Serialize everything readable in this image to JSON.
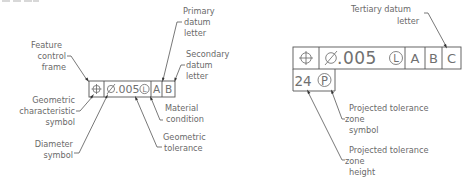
{
  "left_diagram": {
    "frame": {
      "cells": [
        {
          "id": "geometric_characteristic",
          "symbol": "position-icon",
          "text": "⌖"
        },
        {
          "id": "tolerance",
          "diameter": "Ø",
          "value": ".005",
          "modifier": "L"
        },
        {
          "id": "primary_datum",
          "text": "A"
        },
        {
          "id": "secondary_datum",
          "text": "B"
        }
      ]
    },
    "labels": {
      "feature_control_frame": [
        "Feature",
        "control",
        "frame"
      ],
      "geometric_characteristic_symbol": [
        "Geometric",
        "characteristic",
        "symbol"
      ],
      "diameter_symbol": [
        "Diameter",
        "symbol"
      ],
      "primary_datum_letter": [
        "Primary",
        "datum",
        "letter"
      ],
      "secondary_datum_letter": [
        "Secondary",
        "datum",
        "letter"
      ],
      "material_condition": [
        "Material",
        "condition"
      ],
      "geometric_tolerance": [
        "Geometric",
        "tolerance"
      ]
    }
  },
  "right_diagram": {
    "frame": {
      "row1": [
        {
          "id": "geometric_characteristic",
          "symbol": "position-icon"
        },
        {
          "id": "tolerance",
          "diameter": "Ø",
          "value": ".005",
          "modifier": "L"
        },
        {
          "id": "primary_datum",
          "text": "A"
        },
        {
          "id": "secondary_datum",
          "text": "B"
        },
        {
          "id": "tertiary_datum",
          "text": "C"
        }
      ],
      "row2": {
        "height": "24",
        "modifier": "P"
      }
    },
    "labels": {
      "tertiary_datum_letter": [
        "Tertiary datum",
        "letter"
      ],
      "projected_zone_symbol": [
        "Projected tolerance",
        "zone",
        "symbol"
      ],
      "projected_zone_height": [
        "Projected tolerance",
        "zone",
        "height"
      ]
    }
  }
}
